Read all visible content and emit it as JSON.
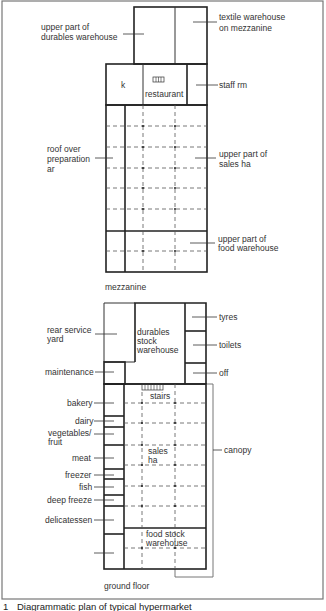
{
  "figure": {
    "caption_number": "1",
    "caption_text": "Diagrammatic plan of typical hypermarket"
  },
  "mezzanine": {
    "title": "mezzanine",
    "labels": {
      "durables_upper": [
        "upper part of",
        "durables warehouse"
      ],
      "textile": [
        "textile warehouse",
        "on mezzanine"
      ],
      "kitchen": "k",
      "restaurant": "restaurant",
      "staff_room": "staff rm",
      "roof_prep": [
        "roof over",
        "preparation",
        "ar"
      ],
      "sales_upper": [
        "upper part of",
        "sales ha"
      ],
      "food_upper": [
        "upper part of",
        "food warehouse"
      ]
    }
  },
  "ground_floor": {
    "title": "ground floor",
    "labels": {
      "rear_service_yard": [
        "rear service",
        "yard"
      ],
      "durables_stock": [
        "durables",
        "stock",
        "warehouse"
      ],
      "tyres": "tyres",
      "toilets": "toilets",
      "office": "off",
      "maintenance": "maintenance",
      "stairs": "stairs",
      "bakery": "bakery",
      "dairy": "dairy",
      "vegetables_fruit": [
        "vegetables/",
        "fruit"
      ],
      "meat": "meat",
      "freezer": "freezer",
      "fish": "fish",
      "deep_freeze": "deep freeze",
      "delicatessen": "delicatessen",
      "sales_hall": [
        "sales",
        "ha"
      ],
      "canopy": "canopy",
      "food_stock": [
        "food stock",
        "warehouse"
      ]
    }
  }
}
